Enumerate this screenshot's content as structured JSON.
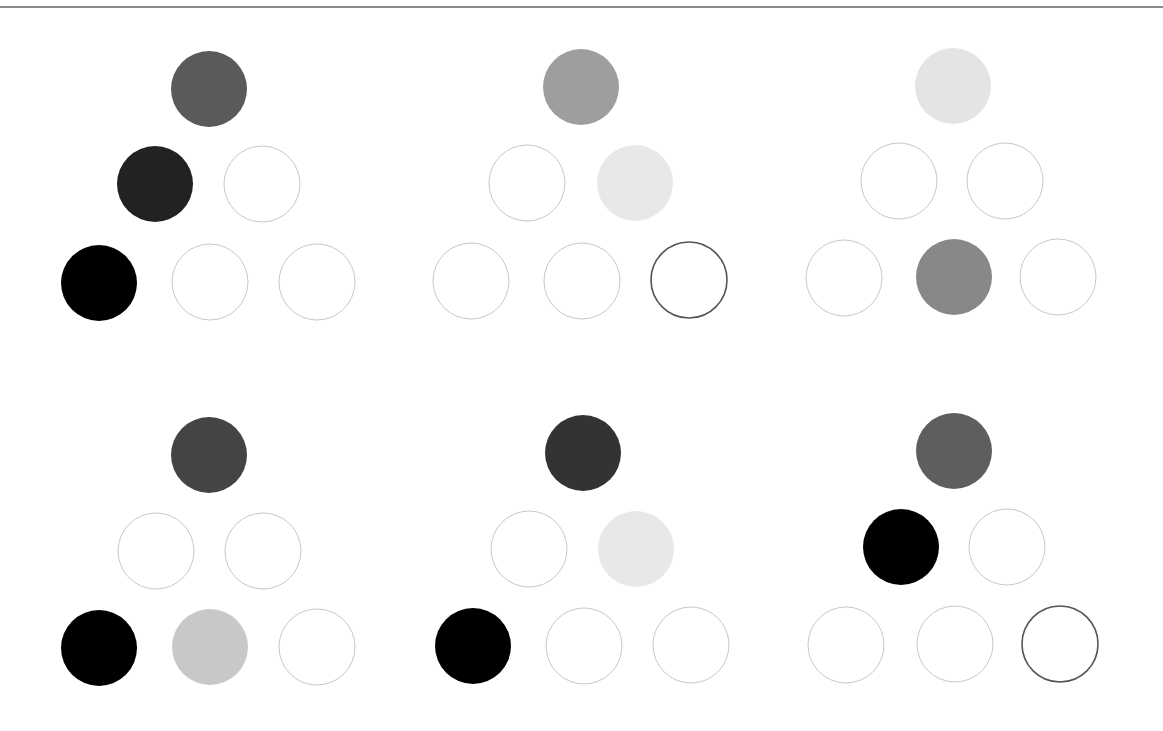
{
  "figure": {
    "width": 1163,
    "height": 731,
    "background": "#ffffff",
    "top_rule_color": "#8a8a8a",
    "circle_radius": 38,
    "outline_light_color": "#c8c8c8",
    "outline_dark_color": "#555555"
  },
  "panels": [
    {
      "id": "panel-1",
      "circles": [
        {
          "cx": 209,
          "cy": 89,
          "state": "filled",
          "fill": "#5a5a5a"
        },
        {
          "cx": 155,
          "cy": 184,
          "state": "filled",
          "fill": "#222222"
        },
        {
          "cx": 262,
          "cy": 184,
          "state": "empty"
        },
        {
          "cx": 99,
          "cy": 283,
          "state": "filled",
          "fill": "#000000"
        },
        {
          "cx": 210,
          "cy": 282,
          "state": "empty"
        },
        {
          "cx": 317,
          "cy": 282,
          "state": "empty"
        }
      ]
    },
    {
      "id": "panel-2",
      "circles": [
        {
          "cx": 581,
          "cy": 87,
          "state": "filled",
          "fill": "#9e9e9e"
        },
        {
          "cx": 527,
          "cy": 183,
          "state": "empty"
        },
        {
          "cx": 635,
          "cy": 183,
          "state": "filled",
          "fill": "#e8e8e8"
        },
        {
          "cx": 471,
          "cy": 281,
          "state": "empty"
        },
        {
          "cx": 582,
          "cy": 281,
          "state": "empty"
        },
        {
          "cx": 689,
          "cy": 280,
          "state": "highlighted"
        }
      ]
    },
    {
      "id": "panel-3",
      "circles": [
        {
          "cx": 953,
          "cy": 86,
          "state": "filled",
          "fill": "#e4e4e4"
        },
        {
          "cx": 899,
          "cy": 181,
          "state": "empty"
        },
        {
          "cx": 1005,
          "cy": 181,
          "state": "empty"
        },
        {
          "cx": 844,
          "cy": 278,
          "state": "empty"
        },
        {
          "cx": 954,
          "cy": 277,
          "state": "filled",
          "fill": "#888888"
        },
        {
          "cx": 1058,
          "cy": 277,
          "state": "empty"
        }
      ]
    },
    {
      "id": "panel-4",
      "circles": [
        {
          "cx": 209,
          "cy": 455,
          "state": "filled",
          "fill": "#444444"
        },
        {
          "cx": 156,
          "cy": 551,
          "state": "empty"
        },
        {
          "cx": 263,
          "cy": 551,
          "state": "empty"
        },
        {
          "cx": 99,
          "cy": 648,
          "state": "filled",
          "fill": "#000000"
        },
        {
          "cx": 210,
          "cy": 647,
          "state": "filled",
          "fill": "#c8c8c8"
        },
        {
          "cx": 317,
          "cy": 647,
          "state": "empty"
        }
      ]
    },
    {
      "id": "panel-5",
      "circles": [
        {
          "cx": 583,
          "cy": 453,
          "state": "filled",
          "fill": "#333333"
        },
        {
          "cx": 529,
          "cy": 549,
          "state": "empty"
        },
        {
          "cx": 636,
          "cy": 549,
          "state": "filled",
          "fill": "#e8e8e8"
        },
        {
          "cx": 473,
          "cy": 646,
          "state": "filled",
          "fill": "#000000"
        },
        {
          "cx": 584,
          "cy": 646,
          "state": "empty"
        },
        {
          "cx": 691,
          "cy": 645,
          "state": "empty"
        }
      ]
    },
    {
      "id": "panel-6",
      "circles": [
        {
          "cx": 954,
          "cy": 451,
          "state": "filled",
          "fill": "#5e5e5e"
        },
        {
          "cx": 901,
          "cy": 547,
          "state": "filled",
          "fill": "#000000"
        },
        {
          "cx": 1007,
          "cy": 547,
          "state": "empty"
        },
        {
          "cx": 846,
          "cy": 645,
          "state": "empty"
        },
        {
          "cx": 955,
          "cy": 644,
          "state": "empty"
        },
        {
          "cx": 1060,
          "cy": 644,
          "state": "highlighted"
        }
      ]
    }
  ]
}
